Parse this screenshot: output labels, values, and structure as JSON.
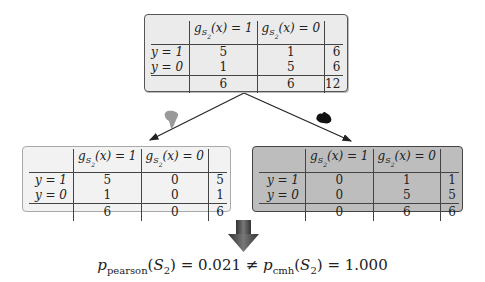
{
  "diagram": {
    "top_table": {
      "columns": [
        "g_S2(x) = 1",
        "g_S2(x) = 0",
        ""
      ],
      "rows": [
        {
          "label": "y = 1",
          "values": [
            "5",
            "1",
            "6"
          ]
        },
        {
          "label": "y = 0",
          "values": [
            "1",
            "5",
            "6"
          ]
        }
      ],
      "totals": [
        "6",
        "6",
        "12"
      ],
      "fill": "#ebebeb"
    },
    "left_table": {
      "region_icon": "africa-icon",
      "icon_color": "#9a9a9a",
      "columns": [
        "g_S2(x) = 1",
        "g_S2(x) = 0",
        ""
      ],
      "rows": [
        {
          "label": "y = 1",
          "values": [
            "5",
            "0",
            "5"
          ]
        },
        {
          "label": "y = 0",
          "values": [
            "1",
            "0",
            "1"
          ]
        }
      ],
      "totals": [
        "6",
        "0",
        "6"
      ],
      "fill": "#f2f2f2"
    },
    "right_table": {
      "region_icon": "australia-icon",
      "icon_color": "#111111",
      "columns": [
        "g_S2(x) = 1",
        "g_S2(x) = 0",
        ""
      ],
      "rows": [
        {
          "label": "y = 1",
          "values": [
            "0",
            "1",
            "1"
          ]
        },
        {
          "label": "y = 0",
          "values": [
            "0",
            "5",
            "5"
          ]
        }
      ],
      "totals": [
        "0",
        "6",
        "6"
      ],
      "fill": "#bdbdbd"
    },
    "header_parts": {
      "g": "g",
      "S": "S",
      "two": "2",
      "x1": "(x) = 1",
      "x0": "(x) = 0"
    },
    "formula": {
      "p": "p",
      "pearson_sub": "pearson",
      "arg": "(",
      "S": "S",
      "two": "2",
      "close": ")",
      "eq1": " = 0.021 ≠ ",
      "cmh_sub": "cmh",
      "eq2": " = 1.000",
      "full_text": "p_pearson(S_2) = 0.021 ≠ p_cmh(S_2) = 1.000"
    }
  }
}
